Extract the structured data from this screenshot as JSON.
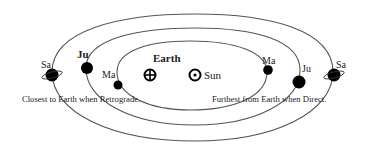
{
  "diagram": {
    "bodies": {
      "earth": "Earth",
      "sun": "Sun",
      "mars_left": "Ma",
      "mars_right": "Ma",
      "jupiter_left": "Ju",
      "jupiter_right": "Ju",
      "saturn_left": "Sa",
      "saturn_right": "Sa"
    },
    "captions": {
      "left": "Closest to Earth when Retrograde.",
      "right": "Furthest from Earth when Direct."
    },
    "colors": {
      "line": "#555555",
      "planet": "#000000",
      "background": "#ffffff"
    }
  }
}
